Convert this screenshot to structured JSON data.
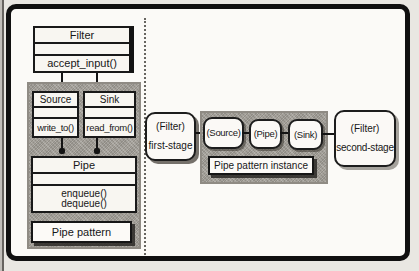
{
  "left_diagram": {
    "filter_class": {
      "name": "Filter",
      "method": "accept_input()"
    },
    "source_class": {
      "name": "Source",
      "method": "write_to()"
    },
    "sink_class": {
      "name": "Sink",
      "method": "read_from()"
    },
    "pipe_class": {
      "name": "Pipe",
      "method_1": "enqueue()",
      "method_2": "dequeue()"
    },
    "caption": "Pipe pattern"
  },
  "right_diagram": {
    "first_stage": {
      "role": "(Filter)",
      "label": "first-stage"
    },
    "source_instance": "(Source)",
    "pipe_instance": "(Pipe)",
    "sink_instance": "(Sink)",
    "caption": "Pipe pattern instance",
    "second_stage": {
      "role": "(Filter)",
      "label": "second-stage"
    }
  },
  "colors": {
    "frame_border": "#101010",
    "container_gray": "#a4a099",
    "box_fill": "#f8f6f1",
    "line_black": "#141414",
    "page_background": "#e9e7e2"
  }
}
